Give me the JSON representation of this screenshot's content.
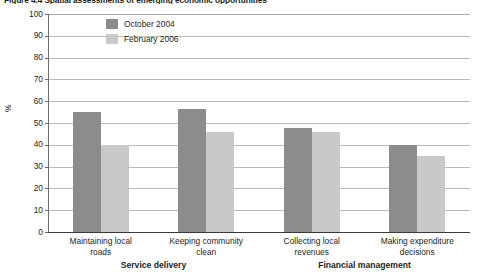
{
  "figure": {
    "caption": "Figure 4.4  Spatial assessments of emerging economic opportunities"
  },
  "chart_data": {
    "type": "bar",
    "title": "",
    "xlabel": "",
    "ylabel": "%",
    "ylim": [
      0,
      100
    ],
    "ytick_step": 10,
    "ytick_labels": [
      "100",
      "90",
      "80",
      "70",
      "60",
      "50",
      "40",
      "30",
      "20",
      "10",
      "0"
    ],
    "grid": true,
    "legend_position": "top-left-inside",
    "categories": [
      "Maintaining local roads",
      "Keeping community clean",
      "Collecting local revenues",
      "Making expenditure decisions"
    ],
    "category_lines": [
      [
        "Maintaining local",
        "roads"
      ],
      [
        "Keeping community",
        "clean"
      ],
      [
        "Collecting local",
        "revenues"
      ],
      [
        "Making expenditure",
        "decisions"
      ]
    ],
    "groups": [
      {
        "label": "Service delivery",
        "categories": [
          "Maintaining local roads",
          "Keeping community clean"
        ]
      },
      {
        "label": "Financial management",
        "categories": [
          "Collecting local revenues",
          "Making expenditure decisions"
        ]
      }
    ],
    "series": [
      {
        "name": "October 2004",
        "color": "#8c8c8c",
        "values": [
          55,
          56.5,
          47.5,
          40
        ]
      },
      {
        "name": "February 2006",
        "color": "#c9c9c9",
        "values": [
          40,
          46,
          46,
          35
        ]
      }
    ]
  }
}
